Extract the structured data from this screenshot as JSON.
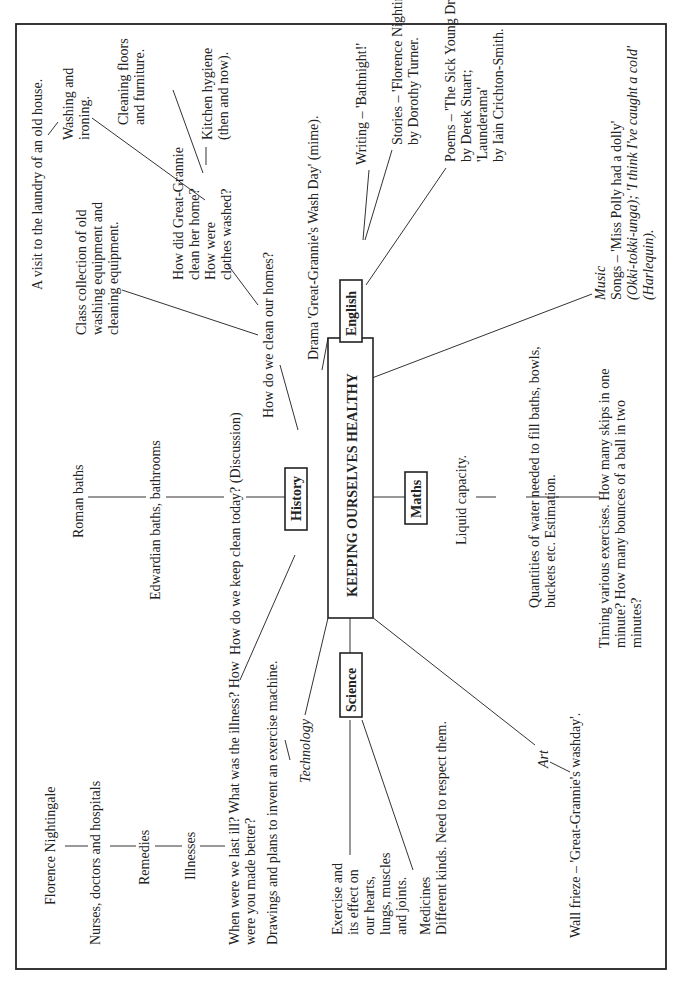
{
  "diagram": {
    "title": "KEEPING OURSELVES HEALTHY",
    "orientation": "rotated 90° counter-clockwise",
    "subjects": {
      "history": "History",
      "english": "English",
      "maths": "Maths",
      "science": "Science"
    },
    "history": {
      "chain_top": [
        "Roman baths",
        "Edwardian baths, bathrooms",
        "How do we keep clean today? (Discussion)"
      ],
      "clean_homes": "How do we clean our homes?",
      "class_collection": [
        "Class collection of old",
        "washing equipment and",
        "cleaning equipment."
      ],
      "great_grannie": [
        "How did Great-Grannie",
        "clean her home?",
        "How were",
        "clothes washed?"
      ],
      "visit": "A visit to the laundry of an old house.",
      "washing": [
        "Washing and",
        "ironing."
      ],
      "cleaning_floors": [
        "Cleaning floors",
        "and furniture."
      ],
      "kitchen": [
        "Kitchen hygiene",
        "(then and now)."
      ],
      "illness_question": [
        "When were we last ill? What was the illness? How",
        "were you made better?"
      ],
      "chain_illness": [
        "Florence Nightingale",
        "Nurses, doctors and hospitals",
        "Remedies",
        "Illnesses"
      ]
    },
    "english": {
      "drama": "Drama 'Great-Grannie's Wash Day' (mime).",
      "writing": "Writing – 'Bathnight!'",
      "stories": [
        "Stories – 'Florence Nightingale'",
        "by Dorothy Turner."
      ],
      "poems": [
        "Poems – 'The Sick Young Dragon'",
        "by Derek Stuart;",
        "'Launderama'",
        "by Iain Crichton-Smith."
      ]
    },
    "music": {
      "label": "Music",
      "lines": [
        "Songs – 'Miss Polly had a dolly'",
        "(Okki-tokki-unga); 'I think I've caught a cold'",
        "(Harlequin)."
      ]
    },
    "maths": {
      "liquid": "Liquid capacity.",
      "quantities": [
        "Quantities of water needed to fill baths, bowls,",
        "buckets etc. Estimation."
      ],
      "timing": [
        "Timing various exercises. How many skips in one",
        "minute? How many bounces of a ball in two",
        "minutes?"
      ]
    },
    "technology": {
      "label": "Technology",
      "drawings": "Drawings and plans to invent an exercise machine."
    },
    "science": {
      "exercise": [
        "Exercise and",
        "its effect on",
        "our hearts,",
        "lungs, muscles",
        "and joints."
      ],
      "medicines": [
        "Medicines",
        "Different kinds. Need to respect them."
      ]
    },
    "art": {
      "label": "Art",
      "frieze": "Wall frieze – 'Great-Grannie's washday'."
    }
  }
}
